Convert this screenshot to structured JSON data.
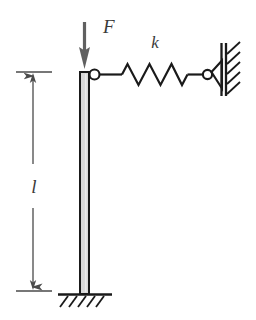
{
  "figure": {
    "labels": {
      "force": "F",
      "spring_stiffness": "k",
      "length": "l"
    },
    "icons": {
      "force_arrow": "down-arrow-icon",
      "spring": "spring-zigzag-icon",
      "hinge_top": "hinge-circle-icon",
      "pin_support": "pin-support-triangle-icon",
      "wall": "hatched-wall-icon",
      "ground": "fixed-base-hatch-icon",
      "dimension": "double-arrow-dimension-icon"
    },
    "colors": {
      "stroke": "#1a1a1a",
      "column_fill": "#d9d9d9",
      "arrow": "#555555",
      "dimension": "#4a4a4a",
      "label": "#3a3a3a",
      "background": "#ffffff"
    },
    "geometry": {
      "column_x": 80,
      "column_width": 9,
      "column_top_y": 72,
      "column_base_y": 294,
      "spring_y": 74,
      "spring_start_x": 98,
      "spring_end_x": 205,
      "wall_x": 222,
      "dimension_x": 33,
      "dimension_top_y": 72,
      "dimension_bottom_y": 290
    }
  }
}
